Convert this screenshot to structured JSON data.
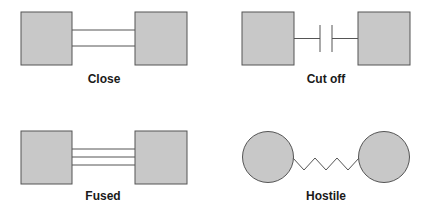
{
  "diagrams": [
    {
      "id": "close",
      "label": "Close",
      "shape": "square",
      "connector": "double-line"
    },
    {
      "id": "cut-off",
      "label": "Cut off",
      "shape": "square",
      "connector": "broken-line"
    },
    {
      "id": "fused",
      "label": "Fused",
      "shape": "square",
      "connector": "triple-line"
    },
    {
      "id": "hostile",
      "label": "Hostile",
      "shape": "circle",
      "connector": "zigzag"
    }
  ],
  "colors": {
    "fill": "#c8c8c8",
    "stroke": "#555555",
    "text": "#1a1a1a"
  }
}
